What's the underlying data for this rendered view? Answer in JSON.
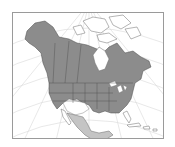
{
  "map": {
    "title": "North America range map",
    "colors": {
      "background": "#ffffff",
      "frame": "#9a9a9a",
      "graticule": "#d8d8d8",
      "land": "#ffffff",
      "coast": "#6a6a6a",
      "range_primary": "#8c8c8c",
      "range_secondary": "#c4c4c4",
      "borders": "#4a4a4a"
    },
    "regions": [
      {
        "name": "Alaska / Canada / USA",
        "shade": "range_primary"
      },
      {
        "name": "Mexico",
        "shade": "range_secondary"
      }
    ]
  }
}
